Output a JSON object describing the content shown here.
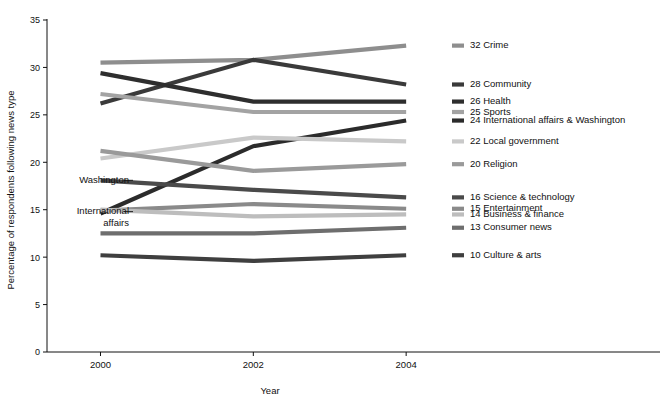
{
  "chart_data": {
    "type": "line",
    "title": "",
    "xlabel": "Year",
    "ylabel": "Percentage of respondents following news type",
    "x": [
      2000,
      2002,
      2004
    ],
    "xticklabels": [
      "2000",
      "2002",
      "2004"
    ],
    "yticklabels": [
      "0",
      "5",
      "10",
      "15",
      "20",
      "25",
      "30",
      "35"
    ],
    "yticks": [
      0,
      5,
      10,
      15,
      20,
      25,
      30,
      35
    ],
    "ylim": [
      0,
      35
    ],
    "xlim": [
      1999.3,
      2004.6
    ],
    "grid": false,
    "legend_position": "right-inline-end-labels",
    "series": [
      {
        "name": "Crime",
        "end_value": 32,
        "end_label": "32 Crime",
        "values": [
          30.5,
          30.8,
          32.3
        ],
        "color": "#8e8e8e"
      },
      {
        "name": "Community",
        "end_value": 28,
        "end_label": "28 Community",
        "values": [
          26.2,
          30.8,
          28.2
        ],
        "color": "#3a3a3a"
      },
      {
        "name": "Health",
        "end_value": 26,
        "end_label": "26 Health",
        "values": [
          29.4,
          26.4,
          26.4
        ],
        "color": "#2e2e2e"
      },
      {
        "name": "Sports",
        "end_value": 25,
        "end_label": "25 Sports",
        "values": [
          27.2,
          25.3,
          25.3
        ],
        "color": "#a3a3a3"
      },
      {
        "name": "International affairs & Washington",
        "end_value": 24,
        "end_label": "24 International affairs & Washington",
        "values": [
          14.6,
          21.7,
          24.4
        ],
        "color": "#2b2b2b"
      },
      {
        "name": "Local government",
        "end_value": 22,
        "end_label": "22 Local government",
        "values": [
          20.4,
          22.6,
          22.2
        ],
        "color": "#c9c9c9"
      },
      {
        "name": "Religion",
        "end_value": 20,
        "end_label": "20 Religion",
        "values": [
          21.2,
          19.1,
          19.8
        ],
        "color": "#9a9a9a"
      },
      {
        "name": "Science & technology",
        "end_value": 16,
        "end_label": "16 Science & technology",
        "values": [
          18.1,
          17.1,
          16.3
        ],
        "color": "#4a4a4a"
      },
      {
        "name": "Entertainment",
        "end_value": 15,
        "end_label": "15 Entertainment",
        "values": [
          14.9,
          15.6,
          15.1
        ],
        "color": "#8a8a8a"
      },
      {
        "name": "Business & finance",
        "end_value": 14,
        "end_label": "14 Business & finance",
        "values": [
          15.0,
          14.3,
          14.5
        ],
        "color": "#bdbdbd"
      },
      {
        "name": "Consumer news",
        "end_value": 13,
        "end_label": "13 Consumer news",
        "values": [
          12.5,
          12.5,
          13.1
        ],
        "color": "#6e6e6e"
      },
      {
        "name": "Culture & arts",
        "end_value": 10,
        "end_label": "10 Culture & arts",
        "values": [
          10.2,
          9.6,
          10.2
        ],
        "color": "#3f3f3f"
      }
    ],
    "left_annotations": [
      {
        "label": "Washington",
        "value": 18.1,
        "line2": ""
      },
      {
        "label": "International",
        "value": 14.8,
        "line2": "affairs"
      }
    ],
    "left_annotation_text": {
      "washington": "Washington",
      "international_line1": "International",
      "international_line2": "affairs"
    }
  }
}
